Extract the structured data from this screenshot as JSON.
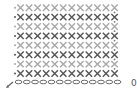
{
  "diagram": {
    "type": "crochet-stitch-chart",
    "stitch_names": {
      "single_crochet": "x",
      "chain": "oval",
      "turning_chain_marker": "dot"
    },
    "foundation_chain_count": 13,
    "rows": [
      {
        "row": 1,
        "stitches": 12,
        "tone": "dark"
      },
      {
        "row": 2,
        "stitches": 12,
        "tone": "light"
      },
      {
        "row": 3,
        "stitches": 12,
        "tone": "dark"
      },
      {
        "row": 4,
        "stitches": 12,
        "tone": "light"
      },
      {
        "row": 5,
        "stitches": 12,
        "tone": "dark"
      },
      {
        "row": 6,
        "stitches": 12,
        "tone": "light"
      },
      {
        "row": 7,
        "stitches": 12,
        "tone": "dark"
      },
      {
        "row": 8,
        "stitches": 12,
        "tone": "light"
      }
    ],
    "start_label": "0",
    "colors": {
      "dark": "#555555",
      "light": "#a8a8a8",
      "chain": "#6a6a6a",
      "marker": "#7a7a7a"
    }
  }
}
